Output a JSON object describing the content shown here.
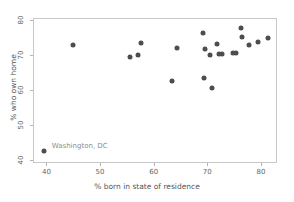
{
  "chart_data": {
    "type": "scatter",
    "title": "",
    "xlabel": "% born in state of residence",
    "ylabel": "% who own home",
    "xlim": [
      37.5,
      83.0
    ],
    "ylim": [
      39.0,
      80.5
    ],
    "xticks": [
      40,
      50,
      60,
      70,
      80
    ],
    "yticks": [
      40,
      50,
      60,
      70,
      80
    ],
    "xtick_labels": [
      "40",
      "50",
      "60",
      "70",
      "80"
    ],
    "ytick_labels": [
      "40",
      "50",
      "60",
      "70",
      "80"
    ],
    "grid": false,
    "legend": "none",
    "marker_color": "#4d4d4d",
    "frame_color": "#c8c8c8",
    "annotations": [
      {
        "text": "Washington, DC",
        "x": 41.0,
        "y": 43.6,
        "color": "#8c8c8c"
      }
    ],
    "points": [
      {
        "x": 39.5,
        "y": 42.5
      },
      {
        "x": 44.9,
        "y": 72.7
      },
      {
        "x": 55.6,
        "y": 69.2
      },
      {
        "x": 57.0,
        "y": 69.8
      },
      {
        "x": 57.7,
        "y": 73.4
      },
      {
        "x": 63.5,
        "y": 62.4
      },
      {
        "x": 64.3,
        "y": 71.9
      },
      {
        "x": 69.2,
        "y": 76.2
      },
      {
        "x": 69.3,
        "y": 63.2
      },
      {
        "x": 69.5,
        "y": 71.6
      },
      {
        "x": 70.5,
        "y": 69.8
      },
      {
        "x": 70.8,
        "y": 60.5
      },
      {
        "x": 71.8,
        "y": 73.2
      },
      {
        "x": 72.2,
        "y": 70.2
      },
      {
        "x": 72.8,
        "y": 70.2
      },
      {
        "x": 74.8,
        "y": 70.4
      },
      {
        "x": 75.4,
        "y": 70.6
      },
      {
        "x": 76.3,
        "y": 77.6
      },
      {
        "x": 76.4,
        "y": 75.0
      },
      {
        "x": 77.8,
        "y": 72.7
      },
      {
        "x": 79.4,
        "y": 73.7
      },
      {
        "x": 81.4,
        "y": 74.9
      }
    ]
  }
}
